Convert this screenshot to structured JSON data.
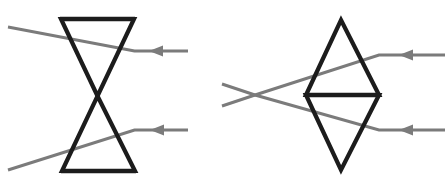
{
  "figure": {
    "background_color": "#ffffff",
    "width": 445,
    "height": 188,
    "colors": {
      "lens_stroke": "#1c1c1c",
      "ray_stroke": "#7b7b7b",
      "background": "#ffffff"
    },
    "panels": [
      {
        "id": "left-panel",
        "name": "diverging-lens-bowtie-diagram",
        "label": "",
        "lens": {
          "name": "bowtie-lens-symbol",
          "shape": "hourglass",
          "description": "Two triangles meeting at a central waist forming a bowtie/hourglass outline",
          "top_bar": {
            "x1": 61,
            "y1": 19,
            "x2": 134,
            "y2": 19
          },
          "bottom_bar": {
            "x1": 62,
            "y1": 171,
            "x2": 135,
            "y2": 171
          },
          "waist": {
            "x": 97.5,
            "y": 96
          },
          "outline_points": "61,19 134,19 62,171 135,171"
        },
        "rays": [
          {
            "name": "upper-ray",
            "direction": "right-to-left",
            "arrowhead": {
              "x": 149,
              "y": 51
            },
            "segments": [
              {
                "x1": 188,
                "y1": 51,
                "x2": 134.5,
                "y2": 51
              },
              {
                "x1": 134.5,
                "y1": 51,
                "x2": 8,
                "y2": 27
              }
            ]
          },
          {
            "name": "lower-ray",
            "direction": "right-to-left",
            "arrowhead": {
              "x": 150,
              "y": 130
            },
            "segments": [
              {
                "x1": 188,
                "y1": 130,
                "x2": 134.5,
                "y2": 130
              },
              {
                "x1": 134.5,
                "y1": 130,
                "x2": 8,
                "y2": 170
              }
            ]
          }
        ]
      },
      {
        "id": "right-panel",
        "name": "diverging-lens-diamond-diagram",
        "label": "",
        "lens": {
          "name": "diamond-lens-symbol",
          "shape": "rhombus-with-midline",
          "description": "A tall diamond outline split by a horizontal midline into two triangles",
          "top_vertex": {
            "x": 341,
            "y": 20
          },
          "bottom_vertex": {
            "x": 341,
            "y": 170
          },
          "left_vertex": {
            "x": 306,
            "y": 95
          },
          "right_vertex": {
            "x": 379,
            "y": 95
          },
          "midline": {
            "x1": 306,
            "y1": 95,
            "x2": 379,
            "y2": 95
          },
          "outline_points": "341,20 379,95 341,170 306,95"
        },
        "rays": [
          {
            "name": "upper-ray",
            "direction": "right-to-left",
            "arrowhead": {
              "x": 399,
              "y": 55
            },
            "crossing": {
              "x": 255,
              "y": 95
            },
            "segments": [
              {
                "x1": 445,
                "y1": 55,
                "x2": 379,
                "y2": 55
              },
              {
                "x1": 379,
                "y1": 55,
                "x2": 255,
                "y2": 95
              },
              {
                "x1": 255,
                "y1": 95,
                "x2": 222,
                "y2": 106
              }
            ]
          },
          {
            "name": "lower-ray",
            "direction": "right-to-left",
            "arrowhead": {
              "x": 399,
              "y": 130
            },
            "crossing": {
              "x": 255,
              "y": 95
            },
            "segments": [
              {
                "x1": 445,
                "y1": 130,
                "x2": 379,
                "y2": 130
              },
              {
                "x1": 379,
                "y1": 130,
                "x2": 255,
                "y2": 95
              },
              {
                "x1": 255,
                "y1": 95,
                "x2": 222,
                "y2": 84
              }
            ]
          }
        ]
      }
    ]
  }
}
